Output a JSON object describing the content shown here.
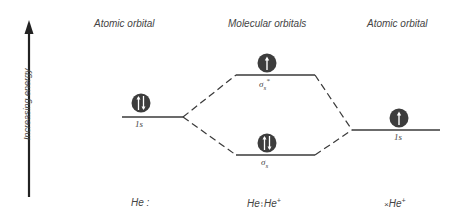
{
  "axis": {
    "label": "Increasing energy",
    "direction": "up"
  },
  "headers": {
    "left": "Atomic orbital",
    "center": "Molecular orbitals",
    "right": "Atomic orbital"
  },
  "levels": [
    {
      "id": "left-1s",
      "label": "1s",
      "electrons": "up-down",
      "column": "left"
    },
    {
      "id": "sigma-star",
      "label": "σs*",
      "electrons": "up",
      "column": "center"
    },
    {
      "id": "sigma",
      "label": "σs",
      "electrons": "up-down",
      "column": "center"
    },
    {
      "id": "right-1s",
      "label": "1s",
      "electrons": "up",
      "column": "right"
    }
  ],
  "labels": {
    "left_1s": "1s",
    "sigma_star_base": "σ",
    "sigma_star_sub": "s",
    "sigma_star_sup": "*",
    "sigma_base": "σ",
    "sigma_sub": "s",
    "right_1s": "1s"
  },
  "formulas": {
    "left": "He :",
    "center_base": "He",
    "center_dots": "⁞",
    "center_ion": "He",
    "center_charge": "+",
    "right_prefix": "×",
    "right_ion": "He",
    "right_charge": "+"
  },
  "colors": {
    "line": "#3a3a3a",
    "electron_fill": "#3d3d3d",
    "electron_arrow": "#ffffff"
  }
}
